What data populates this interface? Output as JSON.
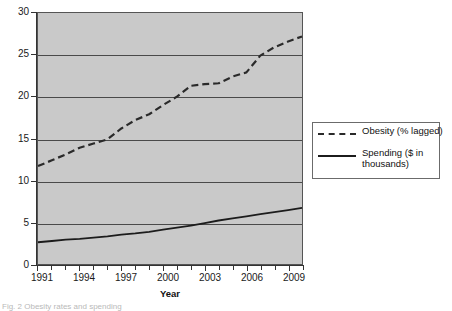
{
  "figure": {
    "caption": "Fig. 2  Obesity rates and spending",
    "background_color": "#ffffff",
    "plot_background_color": "#c9c9c9",
    "gridline_color": "#4a4a4a"
  },
  "legend": {
    "position": "right",
    "entries": [
      {
        "label": "Obesity (% lagged)",
        "style": "dashed",
        "color": "#2a2a2a",
        "icon": "dashed-line-swatch"
      },
      {
        "label": "Spending ($ in thousands)",
        "style": "solid",
        "color": "#1c1c1c",
        "icon": "solid-line-swatch"
      }
    ]
  },
  "chart_data": {
    "type": "line",
    "title": "",
    "subtitle": "",
    "xlabel": "Year",
    "ylabel": "",
    "xlim": [
      1991,
      2010
    ],
    "ylim": [
      0,
      30
    ],
    "grid": true,
    "legend_position": "right",
    "x_tick_labels": [
      "1991",
      "1994",
      "1997",
      "2000",
      "2003",
      "2006",
      "2009"
    ],
    "x_tick_values": [
      1991,
      1994,
      1997,
      2000,
      2003,
      2006,
      2009
    ],
    "x_minor_ticks": [
      1991,
      1992,
      1993,
      1994,
      1995,
      1996,
      1997,
      1998,
      1999,
      2000,
      2001,
      2002,
      2003,
      2004,
      2005,
      2006,
      2007,
      2008,
      2009,
      2010
    ],
    "y_tick_labels": [
      "0",
      "5",
      "10",
      "15",
      "20",
      "25",
      "30"
    ],
    "y_tick_values": [
      0,
      5,
      10,
      15,
      20,
      25,
      30
    ],
    "x": [
      1991,
      1992,
      1993,
      1994,
      1995,
      1996,
      1997,
      1998,
      1999,
      2000,
      2001,
      2002,
      2003,
      2004,
      2005,
      2006,
      2007,
      2008,
      2009,
      2010
    ],
    "series": [
      {
        "name": "Obesity (% lagged)",
        "style": "dashed",
        "color": "#2a2a2a",
        "values": [
          11.7,
          12.4,
          13.1,
          13.9,
          14.4,
          14.9,
          16.2,
          17.2,
          17.9,
          19.0,
          20.0,
          21.3,
          21.5,
          21.6,
          22.4,
          22.9,
          24.9,
          25.9,
          26.6,
          27.2
        ]
      },
      {
        "name": "Spending ($ in thousands)",
        "style": "solid",
        "color": "#1c1c1c",
        "values": [
          2.6,
          2.75,
          2.9,
          3.0,
          3.15,
          3.3,
          3.5,
          3.65,
          3.85,
          4.1,
          4.35,
          4.6,
          4.9,
          5.2,
          5.45,
          5.7,
          5.95,
          6.2,
          6.45,
          6.7
        ]
      }
    ]
  }
}
